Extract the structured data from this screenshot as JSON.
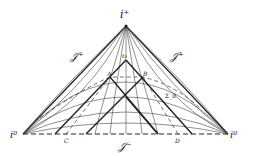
{
  "diagram": {
    "type": "Penrose diagram (Minkowski spacetime)",
    "labels": {
      "future_timelike_infinity": "i⁺",
      "spatial_infinity_left": "i⁰",
      "spatial_infinity_right": "i⁰",
      "future_null_infinity_left": "𝒥⁺",
      "future_null_infinity_right": "𝒥⁺",
      "past_null_infinity": "𝒥⁻",
      "point_top": "t₀",
      "point_a": "A",
      "point_b": "B",
      "point_c": "C",
      "point_d": "D",
      "surface": "Σ_0"
    }
  }
}
